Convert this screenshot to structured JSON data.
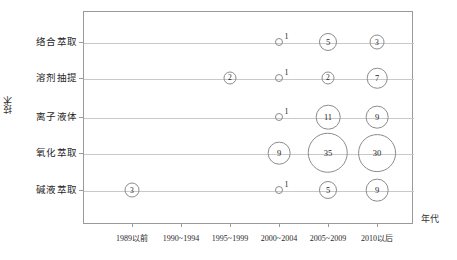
{
  "chart_data": {
    "type": "bar",
    "chart_subtype": "bubble",
    "title": "",
    "xlabel": "年代",
    "ylabel": "技术",
    "grid": true,
    "legend": false,
    "categories": [
      "1989以前",
      "1990~1994",
      "1995~1999",
      "2000~2004",
      "2005~2009",
      "2010以后"
    ],
    "y_categories": [
      "络合萃取",
      "溶剂抽提",
      "离子液体",
      "氧化萃取",
      "碱液萃取"
    ],
    "series": [
      {
        "name": "络合萃取",
        "values": [
          null,
          null,
          null,
          1,
          5,
          3
        ]
      },
      {
        "name": "溶剂抽提",
        "values": [
          null,
          null,
          2,
          1,
          2,
          7
        ]
      },
      {
        "name": "离子液体",
        "values": [
          null,
          null,
          null,
          1,
          11,
          9
        ]
      },
      {
        "name": "氧化萃取",
        "values": [
          null,
          null,
          null,
          9,
          35,
          30
        ]
      },
      {
        "name": "碱液萃取",
        "values": [
          3,
          null,
          null,
          1,
          5,
          9
        ]
      }
    ],
    "points": [
      {
        "row": 0,
        "col": 3,
        "value": 1,
        "label": "1",
        "label_outside": true
      },
      {
        "row": 0,
        "col": 4,
        "value": 5,
        "label": "5",
        "label_outside": false
      },
      {
        "row": 0,
        "col": 5,
        "value": 3,
        "label": "3",
        "label_outside": false
      },
      {
        "row": 1,
        "col": 2,
        "value": 2,
        "label": "2",
        "label_outside": false
      },
      {
        "row": 1,
        "col": 3,
        "value": 1,
        "label": "1",
        "label_outside": true
      },
      {
        "row": 1,
        "col": 4,
        "value": 2,
        "label": "2",
        "label_outside": false
      },
      {
        "row": 1,
        "col": 5,
        "value": 7,
        "label": "7",
        "label_outside": false
      },
      {
        "row": 2,
        "col": 3,
        "value": 1,
        "label": "1",
        "label_outside": true
      },
      {
        "row": 2,
        "col": 4,
        "value": 11,
        "label": "11",
        "label_outside": false
      },
      {
        "row": 2,
        "col": 5,
        "value": 9,
        "label": "9",
        "label_outside": false
      },
      {
        "row": 3,
        "col": 3,
        "value": 9,
        "label": "9",
        "label_outside": false
      },
      {
        "row": 3,
        "col": 4,
        "value": 35,
        "label": "35",
        "label_outside": false
      },
      {
        "row": 3,
        "col": 5,
        "value": 30,
        "label": "30",
        "label_outside": false
      },
      {
        "row": 4,
        "col": 0,
        "value": 3,
        "label": "3",
        "label_outside": false
      },
      {
        "row": 4,
        "col": 3,
        "value": 1,
        "label": "1",
        "label_outside": true
      },
      {
        "row": 4,
        "col": 4,
        "value": 5,
        "label": "5",
        "label_outside": false
      },
      {
        "row": 4,
        "col": 5,
        "value": 9,
        "label": "9",
        "label_outside": false
      }
    ],
    "colors": {
      "bubble_stroke": "#8c8c8c",
      "frame": "#9a9a9a",
      "gridline": "#c9c9c9",
      "text": "#1f1f1f",
      "background": "#ffffff"
    }
  }
}
